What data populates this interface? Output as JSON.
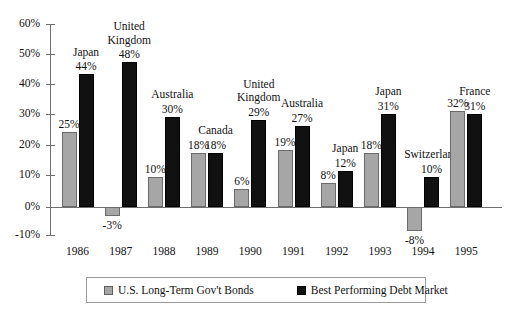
{
  "chart_data": {
    "type": "bar",
    "title": "",
    "xlabel": "",
    "ylabel": "",
    "ylim": [
      -10,
      60
    ],
    "ytick_labels": [
      "60%",
      "50%",
      "40%",
      "30%",
      "20%",
      "10%",
      "0%",
      "-10%"
    ],
    "ytick_values": [
      60,
      50,
      40,
      30,
      20,
      10,
      0,
      -10
    ],
    "grid": false,
    "legend_position": "bottom",
    "categories": [
      "1986",
      "1987",
      "1988",
      "1989",
      "1990",
      "1991",
      "1992",
      "1993",
      "1994",
      "1995"
    ],
    "series": [
      {
        "name": "U.S. Long-Term Gov't Bonds",
        "color": "#a6a6a6",
        "values": [
          25,
          -3,
          10,
          18,
          6,
          19,
          8,
          18,
          -8,
          32
        ],
        "value_labels": [
          "25%",
          "-3%",
          "10%",
          "18%",
          "6%",
          "19%",
          "8%",
          "18%",
          "-8%",
          "32%"
        ]
      },
      {
        "name": "Best Performing Debt Market",
        "color": "#111111",
        "values": [
          44,
          48,
          30,
          18,
          29,
          27,
          12,
          31,
          10,
          31
        ],
        "value_labels": [
          "44%",
          "48%",
          "30%",
          "18%",
          "29%",
          "27%",
          "12%",
          "31%",
          "10%",
          "31%"
        ],
        "annotations": [
          "Japan",
          "United Kingdom",
          "Australia",
          "Canada",
          "United Kingdom",
          "Australia",
          "Japan",
          "Japan",
          "Switzerland",
          "France"
        ]
      }
    ]
  },
  "legend": {
    "items": [
      {
        "label": "U.S. Long-Term Gov't Bonds",
        "color": "#a6a6a6"
      },
      {
        "label": "Best Performing Debt Market",
        "color": "#111111"
      }
    ]
  }
}
